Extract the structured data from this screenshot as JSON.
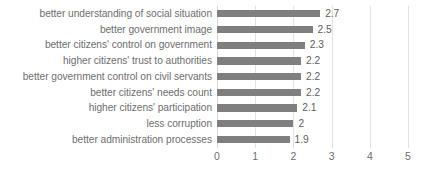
{
  "chart_data": {
    "type": "bar",
    "orientation": "horizontal",
    "title": "",
    "subtitle": "",
    "xlabel": "",
    "ylabel": "",
    "xlim": [
      0,
      5
    ],
    "xticks": [
      "0",
      "1",
      "2",
      "3",
      "4",
      "5"
    ],
    "grid": true,
    "legend": null,
    "bar_color": "#7f7f7f",
    "gridline_color": "#e2e2e2",
    "label_color": "#6e6e6e",
    "categories": [
      "better understanding of social situation",
      "better government image",
      "better citizens' control on government",
      "higher citizens' trust to authorities",
      "better government control on civil servants",
      "better citizens' needs count",
      "higher citizens' participation",
      "less corruption",
      "better administration processes"
    ],
    "values": [
      2.7,
      2.5,
      2.3,
      2.2,
      2.2,
      2.2,
      2.1,
      2,
      1.9
    ],
    "value_labels": [
      "2.7",
      "2.5",
      "2.3",
      "2.2",
      "2.2",
      "2.2",
      "2.1",
      "2",
      "1.9"
    ]
  }
}
